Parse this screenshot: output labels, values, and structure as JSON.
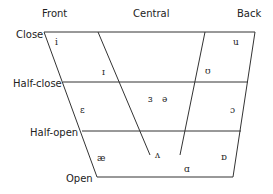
{
  "diagram": {
    "type": "vowel-quadrilateral",
    "columns": [
      "Front",
      "Central",
      "Back"
    ],
    "rows": [
      "Close",
      "Half-close",
      "Half-open",
      "Open"
    ],
    "vowels": [
      {
        "symbol": "i"
      },
      {
        "symbol": "u"
      },
      {
        "symbol": "ɪ"
      },
      {
        "symbol": "ʊ"
      },
      {
        "symbol": "ɜ"
      },
      {
        "symbol": "ə"
      },
      {
        "symbol": "ɛ"
      },
      {
        "symbol": "ɔ"
      },
      {
        "symbol": "æ"
      },
      {
        "symbol": "ʌ"
      },
      {
        "symbol": "ɒ"
      },
      {
        "symbol": "ɑ"
      }
    ],
    "line_color": "#333333"
  }
}
